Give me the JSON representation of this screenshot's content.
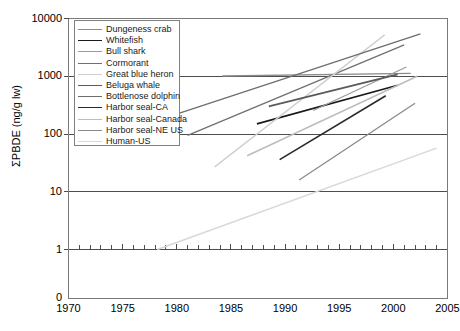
{
  "chart_data": {
    "type": "line",
    "title": "",
    "xlabel": "",
    "ylabel": "ΣPBDE (ng/g lw)",
    "xlim": [
      1970,
      2005
    ],
    "ylim": [
      1,
      10000
    ],
    "yscale": "log",
    "grid": true,
    "legend_position": "upper-left",
    "x_ticks": [
      "1970",
      "1975",
      "1980",
      "1985",
      "1990",
      "1995",
      "2000",
      "2005"
    ],
    "y_ticks": [
      "1",
      "10",
      "100",
      "1000",
      "10000"
    ],
    "zero_label": "0",
    "x_minor_tick_interval": 1,
    "series": [
      {
        "name": "Dungeness crab",
        "color": "#8c8c8c",
        "width": 1.3,
        "points": [
          [
            1984.2,
            1010
          ],
          [
            2001.6,
            1120
          ]
        ]
      },
      {
        "name": "Whitefish",
        "color": "#1a1a1a",
        "width": 1.7,
        "points": [
          [
            1987.4,
            150
          ],
          [
            2000.4,
            700
          ]
        ]
      },
      {
        "name": "Bull shark",
        "color": "#9a9a9a",
        "width": 1.2,
        "points": [
          [
            1992.6,
            255
          ],
          [
            2001.2,
            1450
          ]
        ]
      },
      {
        "name": "Cormorant",
        "color": "#707070",
        "width": 1.3,
        "points": [
          [
            1981.0,
            95
          ],
          [
            2001.0,
            3500
          ]
        ]
      },
      {
        "name": "Great blue heron",
        "color": "#d0d0d0",
        "width": 1.4,
        "points": [
          [
            1983.5,
            27
          ],
          [
            1999.2,
            5200
          ]
        ]
      },
      {
        "name": "Beluga whale",
        "color": "#5a5a5a",
        "width": 1.8,
        "points": [
          [
            1988.5,
            300
          ],
          [
            2000.4,
            1080
          ]
        ]
      },
      {
        "name": "Bottlenose dolphin",
        "color": "#6e6e6e",
        "width": 1.3,
        "points": [
          [
            1978.5,
            180
          ],
          [
            2002.5,
            5400
          ]
        ]
      },
      {
        "name": "Harbor seal-CA",
        "color": "#2a2a2a",
        "width": 1.6,
        "points": [
          [
            1989.5,
            36
          ],
          [
            1999.3,
            460
          ]
        ]
      },
      {
        "name": "Harbor seal-Canada",
        "color": "#bcbcbc",
        "width": 1.4,
        "points": [
          [
            1986.5,
            42
          ],
          [
            2002.2,
            1000
          ]
        ]
      },
      {
        "name": "Harbor seal-NE US",
        "color": "#8a8a8a",
        "width": 1.3,
        "points": [
          [
            1991.3,
            16
          ],
          [
            2002.0,
            340
          ]
        ]
      },
      {
        "name": "Human-US",
        "color": "#d8d8d8",
        "width": 1.5,
        "points": [
          [
            1978.2,
            1.0
          ],
          [
            2004.0,
            57
          ]
        ]
      }
    ]
  },
  "legend": {
    "items": [
      {
        "label": "Dungeness crab"
      },
      {
        "label": "Whitefish"
      },
      {
        "label": "Bull shark"
      },
      {
        "label": "Cormorant"
      },
      {
        "label": "Great blue heron"
      },
      {
        "label": "Beluga whale"
      },
      {
        "label": "Bottlenose dolphin"
      },
      {
        "label": "Harbor seal-CA"
      },
      {
        "label": "Harbor seal-Canada"
      },
      {
        "label": "Harbor seal-NE US"
      },
      {
        "label": "Human-US"
      }
    ]
  },
  "style": {
    "axis_color": "#7a7a7a",
    "grid_color": "#4d4d4d",
    "text_color": "#000000",
    "background": "#ffffff"
  }
}
